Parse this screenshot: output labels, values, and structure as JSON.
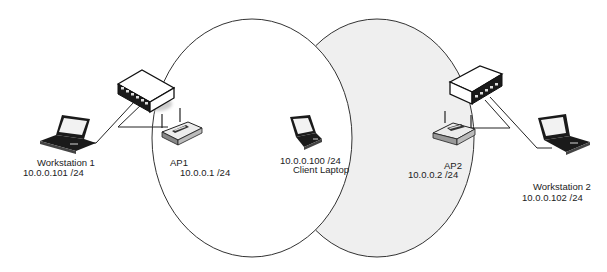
{
  "diagram": {
    "type": "wireless network topology",
    "colors": {
      "background": "#ffffff",
      "cell_ap1_fill": "#ffffff",
      "cell_ap2_fill": "#efefef",
      "outline": "#333333",
      "device_dark": "#1a1a1a"
    },
    "coverage_areas": [
      {
        "id": "ap1-cell",
        "shape": "ellipse",
        "fill": "#ffffff"
      },
      {
        "id": "ap2-cell",
        "shape": "ellipse",
        "fill": "#efefef"
      }
    ],
    "nodes": {
      "workstation1": {
        "icon": "laptop-icon",
        "name": "Workstation 1",
        "ip": "10.0.0.101 /24"
      },
      "switch1": {
        "icon": "switch-icon"
      },
      "ap1": {
        "icon": "access-point-icon",
        "name": "AP1",
        "ip": "10.0.0.1 /24"
      },
      "client": {
        "icon": "laptop-icon",
        "ip": "10.0.0.100 /24",
        "name": "Client Laptop"
      },
      "ap2": {
        "icon": "access-point-icon",
        "name": "AP2",
        "ip": "10.0.0.2 /24"
      },
      "switch2": {
        "icon": "switch-icon"
      },
      "workstation2": {
        "icon": "laptop-icon",
        "name": "Workstation 2",
        "ip": "10.0.0.102 /24"
      }
    },
    "links": [
      {
        "from": "workstation1",
        "to": "switch1",
        "type": "wired"
      },
      {
        "from": "switch1",
        "to": "ap1",
        "type": "wired"
      },
      {
        "from": "switch2",
        "to": "ap2",
        "type": "wired"
      },
      {
        "from": "switch2",
        "to": "workstation2",
        "type": "wired"
      }
    ]
  }
}
